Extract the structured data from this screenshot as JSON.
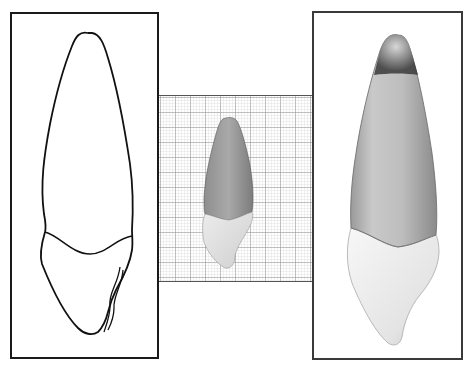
{
  "figure": {
    "panels": [
      {
        "id": "line-drawing",
        "label": ""
      },
      {
        "id": "graph-paper-photo",
        "label": ""
      },
      {
        "id": "shaded-photo",
        "label": ""
      }
    ]
  },
  "colors": {
    "frame": "#1a1a1a",
    "grid_minor": "#c8c8c8",
    "grid_major": "#8a8a8a",
    "root_dark": "#7a7a7a",
    "root_mid": "#a8a8a8",
    "crown_light": "#e6e6e6",
    "outline": "#111111"
  }
}
